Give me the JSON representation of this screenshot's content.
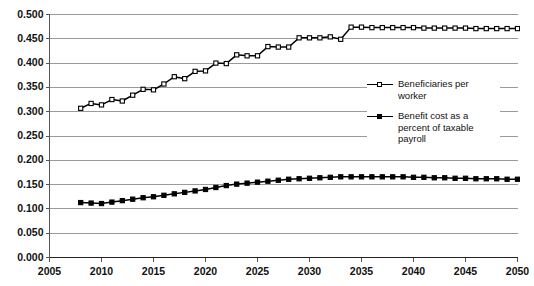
{
  "chart_data": {
    "type": "line",
    "title": "",
    "subtitle": "",
    "xlabel": "",
    "ylabel": "",
    "xlim": [
      2005,
      2050
    ],
    "ylim": [
      0.0,
      0.5
    ],
    "grid": true,
    "legend_position": "center-right",
    "x_ticks": [
      "2005",
      "2010",
      "2015",
      "2020",
      "2025",
      "2030",
      "2035",
      "2040",
      "2045",
      "2050"
    ],
    "y_ticks": [
      "0.000",
      "0.050",
      "0.100",
      "0.150",
      "0.200",
      "0.250",
      "0.300",
      "0.350",
      "0.400",
      "0.450",
      "0.500"
    ],
    "x": [
      2008,
      2009,
      2010,
      2011,
      2012,
      2013,
      2014,
      2015,
      2016,
      2017,
      2018,
      2019,
      2020,
      2021,
      2022,
      2023,
      2024,
      2025,
      2026,
      2027,
      2028,
      2029,
      2030,
      2031,
      2032,
      2033,
      2034,
      2035,
      2036,
      2037,
      2038,
      2039,
      2040,
      2041,
      2042,
      2043,
      2044,
      2045,
      2046,
      2047,
      2048,
      2049,
      2050
    ],
    "series": [
      {
        "name": "Beneficiaries per worker",
        "marker": "open-square",
        "color": "#000000",
        "values": [
          0.307,
          0.317,
          0.314,
          0.325,
          0.322,
          0.334,
          0.346,
          0.345,
          0.357,
          0.372,
          0.368,
          0.383,
          0.384,
          0.4,
          0.399,
          0.417,
          0.415,
          0.415,
          0.434,
          0.433,
          0.433,
          0.452,
          0.452,
          0.452,
          0.454,
          0.449,
          0.474,
          0.474,
          0.473,
          0.473,
          0.473,
          0.473,
          0.473,
          0.472,
          0.472,
          0.472,
          0.472,
          0.472,
          0.471,
          0.471,
          0.471,
          0.471,
          0.471
        ]
      },
      {
        "name": "Benefit cost as a percent of taxable payroll",
        "marker": "filled-square",
        "color": "#000000",
        "values": [
          0.113,
          0.112,
          0.111,
          0.114,
          0.117,
          0.12,
          0.123,
          0.125,
          0.128,
          0.131,
          0.134,
          0.137,
          0.14,
          0.144,
          0.148,
          0.151,
          0.153,
          0.155,
          0.157,
          0.159,
          0.161,
          0.162,
          0.163,
          0.164,
          0.165,
          0.166,
          0.166,
          0.166,
          0.166,
          0.166,
          0.166,
          0.166,
          0.165,
          0.165,
          0.164,
          0.164,
          0.163,
          0.163,
          0.162,
          0.162,
          0.162,
          0.161,
          0.161
        ]
      }
    ]
  },
  "legend": {
    "entries": [
      {
        "label": "Beneficiaries per worker"
      },
      {
        "label": "Benefit cost as a percent of taxable payroll"
      }
    ]
  },
  "colors": {
    "line": "#000000",
    "gridline": "#9a9a9a",
    "axis": "#555555",
    "background": "#ffffff"
  }
}
